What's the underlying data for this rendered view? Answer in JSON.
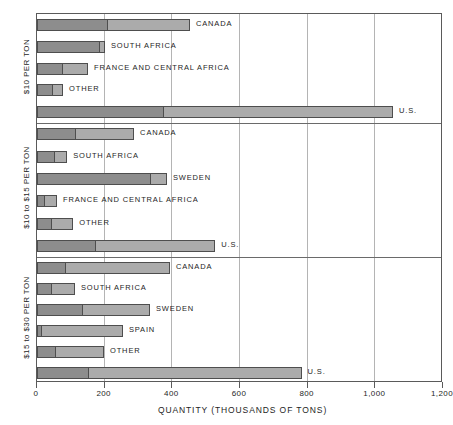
{
  "chart_data": {
    "type": "bar",
    "orientation": "horizontal",
    "stacked": true,
    "title": "",
    "xlabel": "QUANTITY (THOUSANDS OF TONS)",
    "ylabel": "",
    "xlim": [
      0,
      1200
    ],
    "xticks": [
      0,
      200,
      400,
      600,
      800,
      1000,
      1200
    ],
    "xticklabels": [
      "0",
      "200",
      "400",
      "600",
      "800",
      "1,000",
      "1,200"
    ],
    "grid": true,
    "grid_axis": "x",
    "legend": null,
    "series": [
      {
        "name": "lower-cost-segment",
        "color": "#8d8d8d"
      },
      {
        "name": "upper-cost-segment",
        "color": "#ababab"
      }
    ],
    "panels": [
      {
        "label": "$10 PER TON",
        "categories": [
          "CANADA",
          "SOUTH AFRICA",
          "FRANCE AND CENTRAL AFRICA",
          "OTHER",
          "U.S."
        ],
        "segment_a": [
          210,
          186,
          77,
          47,
          375
        ],
        "totals": [
          455,
          204,
          154,
          80,
          1055
        ]
      },
      {
        "label": "$10 to $15 PER TON",
        "categories": [
          "CANADA",
          "SOUTH AFRICA",
          "SWEDEN",
          "FRANCE AND CENTRAL AFRICA",
          "OTHER",
          "U.S."
        ],
        "segment_a": [
          115,
          53,
          337,
          25,
          45,
          175
        ],
        "totals": [
          290,
          92,
          387,
          62,
          110,
          530
        ]
      },
      {
        "label": "$15 to $30 PER TON",
        "categories": [
          "CANADA",
          "SOUTH AFRICA",
          "SWEDEN",
          "SPAIN",
          "OTHER",
          "U.S."
        ],
        "segment_a": [
          86,
          44,
          136,
          15,
          56,
          155
        ],
        "totals": [
          396,
          115,
          337,
          257,
          201,
          785
        ]
      }
    ]
  },
  "axis": {
    "x_title": "QUANTITY (THOUSANDS OF TONS)",
    "ticks": [
      "0",
      "200",
      "400",
      "600",
      "800",
      "1,000",
      "1,200"
    ]
  },
  "panel_labels": {
    "p0": "$10 PER TON",
    "p1": "$10 to $15 PER TON",
    "p2": "$15 to $30 PER TON"
  },
  "bar_labels": {
    "p0": [
      "CANADA",
      "SOUTH AFRICA",
      "FRANCE AND CENTRAL AFRICA",
      "OTHER",
      "U.S."
    ],
    "p1": [
      "CANADA",
      "SOUTH AFRICA",
      "SWEDEN",
      "FRANCE AND CENTRAL AFRICA",
      "OTHER",
      "U.S."
    ],
    "p2": [
      "CANADA",
      "SOUTH AFRICA",
      "SWEDEN",
      "SPAIN",
      "OTHER",
      "U.S."
    ]
  },
  "colors": {
    "segment_dark": "#8d8d8d",
    "segment_light": "#ababab",
    "outline": "#4e4e4e",
    "grid": "#b4b4b4",
    "frame": "#5a5a5a"
  }
}
